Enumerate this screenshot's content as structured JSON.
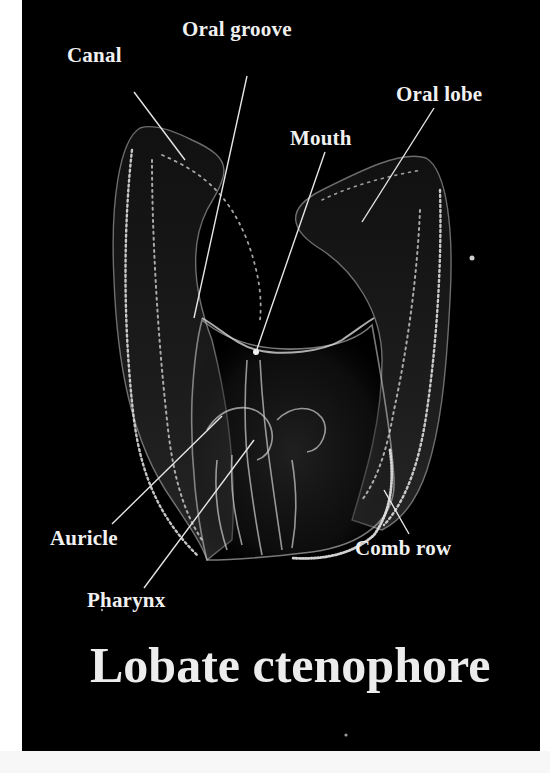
{
  "figure": {
    "title": "Lobate ctenophore",
    "background_color": "#000000",
    "label_color": "#f0f0f0",
    "labels": [
      {
        "id": "canal",
        "text": "Canal",
        "x": 54,
        "y": 50,
        "line": {
          "x1": 112,
          "y1": 92,
          "x2": 163,
          "y2": 160
        }
      },
      {
        "id": "oral-groove",
        "text": "Oral groove",
        "x": 169,
        "y": 23,
        "line": {
          "x1": 225,
          "y1": 76,
          "x2": 172,
          "y2": 318
        }
      },
      {
        "id": "oral-lobe",
        "text": "Oral lobe",
        "x": 380,
        "y": 56,
        "line": {
          "x1": 412,
          "y1": 108,
          "x2": 340,
          "y2": 222
        }
      },
      {
        "id": "mouth",
        "text": "Mouth",
        "x": 267,
        "y": 128,
        "line": {
          "x1": 303,
          "y1": 152,
          "x2": 234,
          "y2": 352
        }
      },
      {
        "id": "auricle",
        "text": "Auricle",
        "x": 28,
        "y": 528,
        "line": {
          "x1": 90,
          "y1": 524,
          "x2": 200,
          "y2": 416
        }
      },
      {
        "id": "pharynx",
        "text": "Pharynx",
        "x": 65,
        "y": 590,
        "line": {
          "x1": 122,
          "y1": 588,
          "x2": 232,
          "y2": 440
        }
      },
      {
        "id": "comb-row",
        "text": "Comb row",
        "x": 332,
        "y": 538,
        "line": {
          "x1": 387,
          "y1": 534,
          "x2": 362,
          "y2": 490
        }
      }
    ]
  }
}
